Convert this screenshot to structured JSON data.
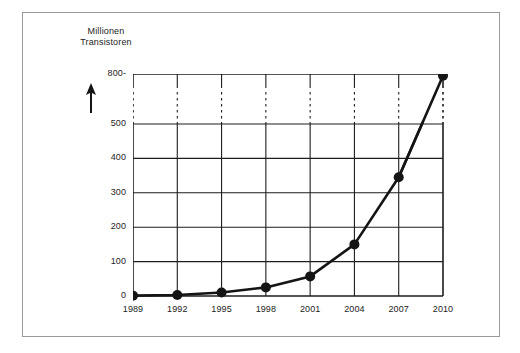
{
  "chart_data": {
    "type": "line",
    "title": "",
    "ylabel": "Millionen Transistoren",
    "xlabel": "",
    "x": [
      1989,
      1992,
      1995,
      1998,
      2001,
      2004,
      2007,
      2010
    ],
    "values": [
      1,
      3,
      10,
      25,
      57,
      150,
      345,
      790
    ],
    "series": [
      {
        "name": "Millionen Transistoren",
        "values": [
          1,
          3,
          10,
          25,
          57,
          150,
          345,
          790
        ]
      }
    ],
    "xtick_labels": [
      "1989",
      "1992",
      "1995",
      "1998",
      "2001",
      "2004",
      "2007",
      "2010"
    ],
    "ytick_labels": [
      "0",
      "100",
      "200",
      "300",
      "400",
      "500",
      "800-"
    ],
    "ytick_values": [
      0,
      100,
      200,
      300,
      400,
      500,
      800
    ],
    "ylim": [
      0,
      800
    ],
    "xlim": [
      1989,
      2010
    ],
    "axis_break": {
      "between": [
        500,
        800
      ],
      "style": "dashed"
    },
    "grid": true,
    "legend": "none",
    "marker": "filled-circle",
    "line_color": "#141414",
    "grid_color": "#1d1d1d",
    "frame_color": "#9a9a9a",
    "background": "#ffffff"
  },
  "axis": {
    "title_line1": "Millionen",
    "title_line2": "Transistoren",
    "arrow_icon": "up-arrow-icon"
  }
}
